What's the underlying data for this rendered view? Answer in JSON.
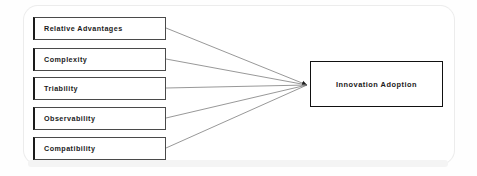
{
  "diagram": {
    "type": "conceptual-model",
    "antecedents": [
      {
        "id": "relative-advantages",
        "label": "Relative Advantages",
        "box": {
          "x": 33,
          "y": 17,
          "w": 133,
          "h": 23
        },
        "anchor": {
          "x": 166,
          "y": 28
        }
      },
      {
        "id": "complexity",
        "label": "Complexity",
        "box": {
          "x": 33,
          "y": 48,
          "w": 133,
          "h": 23
        },
        "anchor": {
          "x": 166,
          "y": 59
        }
      },
      {
        "id": "triability",
        "label": "Triability",
        "box": {
          "x": 33,
          "y": 77,
          "w": 133,
          "h": 23
        },
        "anchor": {
          "x": 166,
          "y": 88
        }
      },
      {
        "id": "observability",
        "label": "Observability",
        "box": {
          "x": 33,
          "y": 107,
          "w": 133,
          "h": 23
        },
        "anchor": {
          "x": 166,
          "y": 118
        }
      },
      {
        "id": "compatibility",
        "label": "Compatibility",
        "box": {
          "x": 33,
          "y": 137,
          "w": 133,
          "h": 23
        },
        "anchor": {
          "x": 166,
          "y": 148
        }
      }
    ],
    "outcome": {
      "id": "innovation-adoption",
      "label": "Innovation Adoption",
      "box": {
        "x": 310,
        "y": 61,
        "w": 133,
        "h": 46
      }
    },
    "convergence_point": {
      "x": 307,
      "y": 85
    },
    "colors": {
      "background": "#fefefe",
      "box_fill": "#ffffff",
      "box_border": "#4a4a4a",
      "box_accent_border": "#1a1a1a",
      "outcome_border": "#111111",
      "connector": "#6b6b6b",
      "text": "#1b1b1b",
      "card_outline": "#dddddd",
      "bottom_band": "#f4f4f4"
    },
    "connector_style": {
      "stroke_width": 0.7,
      "arrowhead": "filled-triangle",
      "direction": "antecedent-to-outcome"
    }
  }
}
